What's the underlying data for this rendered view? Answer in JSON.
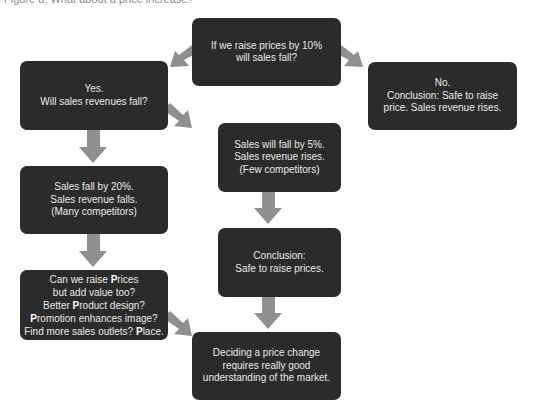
{
  "caption": "Figure 8: What about a price increase?",
  "colors": {
    "box_fill": "#2b2b2b",
    "box_text": "#e9e9e9",
    "arrow": "#8f8f8f",
    "background": "#ffffff"
  },
  "nodes": [
    {
      "id": "question",
      "text": "If we raise prices by 10%\nwill sales fall?"
    },
    {
      "id": "yes",
      "text": "Yes.\nWill sales revenues fall?"
    },
    {
      "id": "no",
      "text": "No.\nConclusion: Safe to raise\nprice. Sales revenue rises."
    },
    {
      "id": "fall5",
      "text": "Sales will fall by 5%.\nSales revenue rises.\n(Few competitors)"
    },
    {
      "id": "fall20",
      "text": "Sales fall by 20%.\nSales revenue falls.\n(Many competitors)"
    },
    {
      "id": "safe",
      "text": "Conclusion:\nSafe to raise prices."
    },
    {
      "id": "four_ps",
      "lines": [
        {
          "pre": "Can we raise ",
          "bold": "P",
          "post": "rices"
        },
        {
          "pre": "but add value too?",
          "bold": "",
          "post": ""
        },
        {
          "pre": "Better ",
          "bold": "P",
          "post": "roduct design?"
        },
        {
          "pre": "",
          "bold": "P",
          "post": "romotion enhances image?"
        },
        {
          "pre": "Find more sales outlets? ",
          "bold": "P",
          "post": "lace."
        }
      ]
    },
    {
      "id": "final",
      "text": "Deciding a price change\nrequires really good\nunderstanding of the market."
    }
  ],
  "edges": [
    {
      "from": "question",
      "to": "yes"
    },
    {
      "from": "question",
      "to": "no"
    },
    {
      "from": "yes",
      "to": "fall20"
    },
    {
      "from": "yes",
      "to": "fall5"
    },
    {
      "from": "fall5",
      "to": "safe"
    },
    {
      "from": "fall20",
      "to": "four_ps"
    },
    {
      "from": "safe",
      "to": "final"
    },
    {
      "from": "four_ps",
      "to": "final"
    }
  ]
}
